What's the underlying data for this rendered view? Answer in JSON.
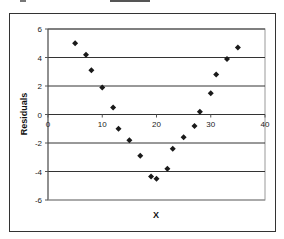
{
  "chart_data": {
    "type": "scatter",
    "title": "",
    "xlabel": "X",
    "ylabel": "Residuals",
    "xlim": [
      0,
      40
    ],
    "ylim": [
      -6,
      6
    ],
    "x_ticks": [
      0,
      10,
      20,
      30,
      40
    ],
    "y_ticks": [
      -6,
      -4,
      -2,
      0,
      2,
      4,
      6
    ],
    "grid": "horizontal major gridlines",
    "legend": "none",
    "marker": "diamond",
    "marker_color": "#1a1a1a",
    "series": [
      {
        "name": "Residuals",
        "x": [
          5,
          7,
          8,
          10,
          12,
          13,
          15,
          17,
          19,
          20,
          22,
          23,
          25,
          27,
          28,
          30,
          31,
          33,
          35
        ],
        "y": [
          5.0,
          4.2,
          3.1,
          1.9,
          0.5,
          -1.0,
          -1.8,
          -2.9,
          -4.35,
          -4.5,
          -3.8,
          -2.4,
          -1.6,
          -0.8,
          0.2,
          1.5,
          2.8,
          3.9,
          4.7
        ]
      }
    ]
  },
  "labels": {
    "xlabel": "X",
    "ylabel": "Residuals"
  }
}
